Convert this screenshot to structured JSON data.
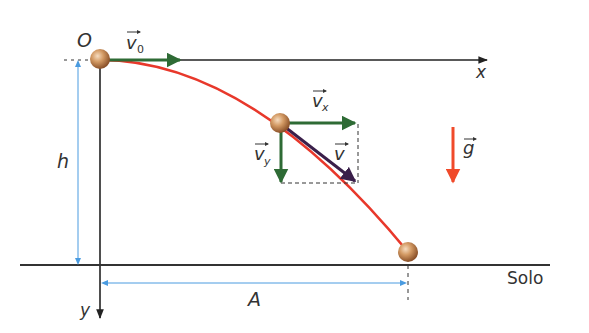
{
  "diagram": {
    "type": "projectile-horizontal-launch",
    "labels": {
      "origin": "O",
      "x_axis": "x",
      "y_axis": "y",
      "height": "h",
      "range": "A",
      "ground": "Solo",
      "v0": "v",
      "v0_sub": "0",
      "vx": "v",
      "vx_sub": "x",
      "vy": "v",
      "vy_sub": "y",
      "v": "v",
      "g": "g"
    },
    "colors": {
      "trajectory": "#e8382b",
      "velocity_components": "#2e6b35",
      "resultant_velocity": "#3a1f4a",
      "gravity": "#f04a2a",
      "dimension": "#4a9be0",
      "axis": "#222222",
      "ball": "#c98a55"
    }
  }
}
